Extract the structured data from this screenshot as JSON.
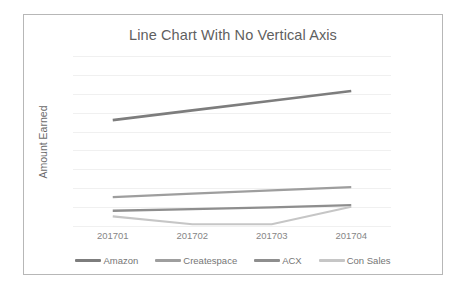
{
  "chart_data": {
    "type": "line",
    "title": "Line Chart With No Vertical Axis",
    "xlabel": "",
    "ylabel": "Amount Earned",
    "categories": [
      "201701",
      "201702",
      "201703",
      "201704"
    ],
    "grid": {
      "horizontal": true,
      "vertical": false,
      "count": 10,
      "color": "#f0f0f0"
    },
    "axes": {
      "vertical_axis_visible": false,
      "vertical_tick_labels_visible": false,
      "horizontal_axis_visible": false
    },
    "ylim": [
      0,
      10
    ],
    "legend": {
      "position": "bottom",
      "orientation": "horizontal"
    },
    "series": [
      {
        "name": "Amazon",
        "color": "#7d7d7d",
        "width": 2.6,
        "values": [
          6.25,
          6.82,
          7.38,
          7.95
        ]
      },
      {
        "name": "Createspace",
        "color": "#9e9e9e",
        "width": 2.3,
        "values": [
          1.75,
          1.95,
          2.14,
          2.33
        ]
      },
      {
        "name": "ACX",
        "color": "#8e8e8e",
        "width": 2.3,
        "values": [
          0.95,
          1.05,
          1.15,
          1.28
        ]
      },
      {
        "name": "Con Sales",
        "color": "#c6c6c6",
        "width": 2.1,
        "values": [
          0.62,
          0.16,
          0.16,
          1.18
        ]
      }
    ]
  }
}
